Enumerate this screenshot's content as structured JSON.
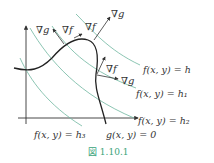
{
  "figure": {
    "caption": "図 1.10.1",
    "colors": {
      "curve": "#222222",
      "contour": "#6fb6a0",
      "axis": "#333333",
      "text": "#333333",
      "caption": "#3aa37a"
    },
    "labels": {
      "grad_g_top_left": "∇g",
      "grad_f_top_left": "∇f",
      "grad_f_top": "∇f",
      "grad_g_top": "∇g",
      "grad_f_right": "∇f",
      "grad_g_right": "∇g",
      "contour_h": "f(x, y) = h",
      "contour_h1": "f(x, y) = h₁",
      "contour_h2": "f(x, y) = h₂",
      "contour_h3": "f(x, y) = h₃",
      "constraint": "g(x, y) = 0"
    }
  }
}
